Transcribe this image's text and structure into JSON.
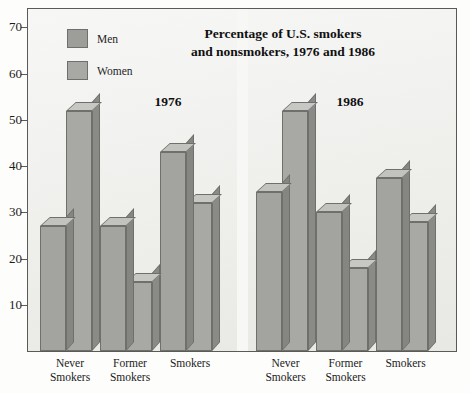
{
  "chart_data": {
    "type": "bar",
    "title": "Percentage of U.S. smokers and nonsmokers, 1976 and 1986",
    "title_line1": "Percentage of U.S. smokers",
    "title_line2": "and nonsmokers, 1976 and 1986",
    "xlabel": "",
    "ylabel": "",
    "ylim": [
      0,
      74
    ],
    "yticks": [
      10,
      20,
      30,
      40,
      50,
      60,
      70
    ],
    "grid": false,
    "legend_position": "top-left",
    "style": "3d-grouped-bars",
    "panels": [
      {
        "name": "1976",
        "categories": [
          "Never Smokers",
          "Former Smokers",
          "Smokers"
        ],
        "series": [
          {
            "name": "Men",
            "values": [
              27,
              27,
              43
            ]
          },
          {
            "name": "Women",
            "values": [
              52,
              15,
              32
            ]
          }
        ]
      },
      {
        "name": "1986",
        "categories": [
          "Never Smokers",
          "Former Smokers",
          "Smokers"
        ],
        "series": [
          {
            "name": "Men",
            "values": [
              34.5,
              30,
              37.5
            ]
          },
          {
            "name": "Women",
            "values": [
              52,
              18,
              28
            ]
          }
        ]
      }
    ],
    "colors": {
      "men_face": "#a3a3a0",
      "women_face": "#a8a8a5",
      "plot_background": "#ededea",
      "axis": "#5a5a57",
      "text": "#101010"
    }
  },
  "legend": {
    "items": [
      {
        "label": "Men",
        "key": "men"
      },
      {
        "label": "Women",
        "key": "women"
      }
    ]
  },
  "axis": {
    "ytick_labels": [
      "70",
      "60",
      "50",
      "40",
      "30",
      "20",
      "10"
    ]
  },
  "panel_labels": [
    "1976",
    "1986"
  ],
  "category_labels": [
    {
      "line1": "Never",
      "line2": "Smokers"
    },
    {
      "line1": "Former",
      "line2": "Smokers"
    },
    {
      "line1": "Smokers",
      "line2": ""
    }
  ]
}
